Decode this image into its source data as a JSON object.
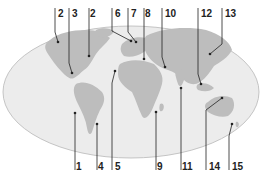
{
  "colors": {
    "background": "#ffffff",
    "ocean": "#ececec",
    "ocean_edge": "#b8b8b8",
    "land": "#bdbdbd",
    "leader": "#222222"
  },
  "markers": [
    {
      "label": "1",
      "lx": 76,
      "ly": 166,
      "px": 75,
      "py": 113,
      "top": false
    },
    {
      "label": "2",
      "lx": 58,
      "ly": 15,
      "px": 58,
      "py": 42,
      "top": true
    },
    {
      "label": "3",
      "lx": 72,
      "ly": 15,
      "px": 72,
      "py": 73,
      "top": true
    },
    {
      "label": "2",
      "lx": 90,
      "ly": 15,
      "px": 89,
      "py": 56,
      "top": true
    },
    {
      "label": "4",
      "lx": 98,
      "ly": 166,
      "px": 97,
      "py": 124,
      "top": false
    },
    {
      "label": "5",
      "lx": 115,
      "ly": 166,
      "px": 115,
      "py": 71,
      "top": false
    },
    {
      "label": "6",
      "lx": 115,
      "ly": 15,
      "px": 131,
      "py": 41,
      "top": true
    },
    {
      "label": "7",
      "lx": 131,
      "ly": 15,
      "px": 136,
      "py": 42,
      "top": true
    },
    {
      "label": "8",
      "lx": 145,
      "ly": 15,
      "px": 144,
      "py": 59,
      "top": true
    },
    {
      "label": "9",
      "lx": 157,
      "ly": 166,
      "px": 156,
      "py": 112,
      "top": false
    },
    {
      "label": "10",
      "lx": 165,
      "ly": 15,
      "px": 165,
      "py": 67,
      "top": true
    },
    {
      "label": "11",
      "lx": 182,
      "ly": 166,
      "px": 181,
      "py": 88,
      "top": false
    },
    {
      "label": "12",
      "lx": 201,
      "ly": 15,
      "px": 201,
      "py": 84,
      "top": true
    },
    {
      "label": "13",
      "lx": 225,
      "ly": 15,
      "px": 210,
      "py": 54,
      "top": true
    },
    {
      "label": "14",
      "lx": 209,
      "ly": 166,
      "px": 222,
      "py": 98,
      "top": false
    },
    {
      "label": "15",
      "lx": 232,
      "ly": 166,
      "px": 232,
      "py": 124,
      "top": false
    }
  ]
}
